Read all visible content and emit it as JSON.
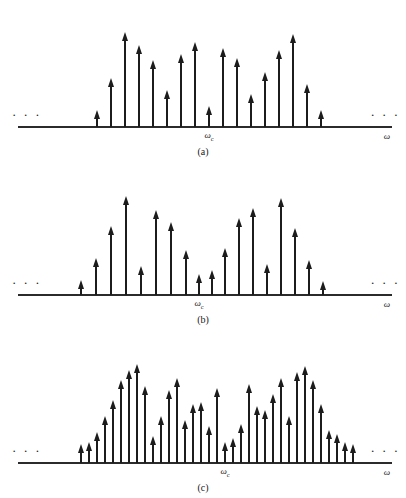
{
  "figure": {
    "background": "#ffffff",
    "ink_color": "#1c1c1c",
    "axis_color": "#2b2b2b",
    "ellipsis_glyph": "· · ·",
    "omega_c_label": "ω",
    "omega_c_sub": "c",
    "omega_label": "ω"
  },
  "chart_data": [
    {
      "type": "bar",
      "panel": "a",
      "title": "",
      "caption": "(a)",
      "xlabel": "ω",
      "ylabel": "",
      "center_tick_label": "ωc",
      "grid": false,
      "legend": null,
      "axis_range_note": "frequency axis extends indefinitely both directions (ellipses shown)",
      "x": [
        96,
        110,
        124,
        138,
        152,
        166,
        180,
        194,
        208,
        222,
        236,
        250,
        264,
        278,
        292,
        306,
        320
      ],
      "values": [
        10,
        42,
        88,
        75,
        60,
        30,
        66,
        78,
        14,
        72,
        62,
        26,
        48,
        70,
        86,
        36,
        10
      ],
      "ylim": [
        0,
        100
      ],
      "n_impulses": 17,
      "center_index": 8
    },
    {
      "type": "bar",
      "panel": "b",
      "title": "",
      "caption": "(b)",
      "xlabel": "ω",
      "ylabel": "",
      "center_tick_label": "ωc",
      "grid": false,
      "legend": null,
      "axis_range_note": "frequency axis extends indefinitely both directions (ellipses shown)",
      "x": [
        80,
        95,
        110,
        125,
        140,
        155,
        170,
        185,
        198,
        211,
        224,
        238,
        252,
        266,
        280,
        294,
        308,
        322
      ],
      "values": [
        8,
        30,
        62,
        92,
        22,
        78,
        66,
        38,
        14,
        18,
        40,
        70,
        80,
        24,
        90,
        60,
        28,
        7
      ],
      "ylim": [
        0,
        100
      ],
      "n_impulses": 18,
      "center_index": 8
    },
    {
      "type": "bar",
      "panel": "c",
      "title": "",
      "caption": "(c)",
      "xlabel": "ω",
      "ylabel": "",
      "center_tick_label": "ωc",
      "grid": false,
      "legend": null,
      "axis_range_note": "frequency axis extends indefinitely both directions (ellipses shown)",
      "x": [
        80,
        88,
        96,
        104,
        112,
        120,
        128,
        136,
        144,
        152,
        160,
        168,
        176,
        184,
        192,
        200,
        208,
        216,
        224,
        232,
        240,
        248,
        256,
        264,
        272,
        280,
        288,
        296,
        304,
        312,
        320
      ],
      "values": [
        12,
        14,
        24,
        40,
        56,
        76,
        86,
        92,
        70,
        20,
        40,
        66,
        78,
        36,
        52,
        54,
        30,
        68,
        14,
        18,
        32,
        72,
        50,
        46,
        62,
        78,
        40,
        84,
        90,
        76,
        52
      ],
      "extra_values": [
        26,
        22,
        14,
        12
      ],
      "extra_x": [
        328,
        336,
        344,
        352
      ],
      "ylim": [
        0,
        100
      ],
      "n_impulses": 35,
      "center_index": 18
    }
  ]
}
